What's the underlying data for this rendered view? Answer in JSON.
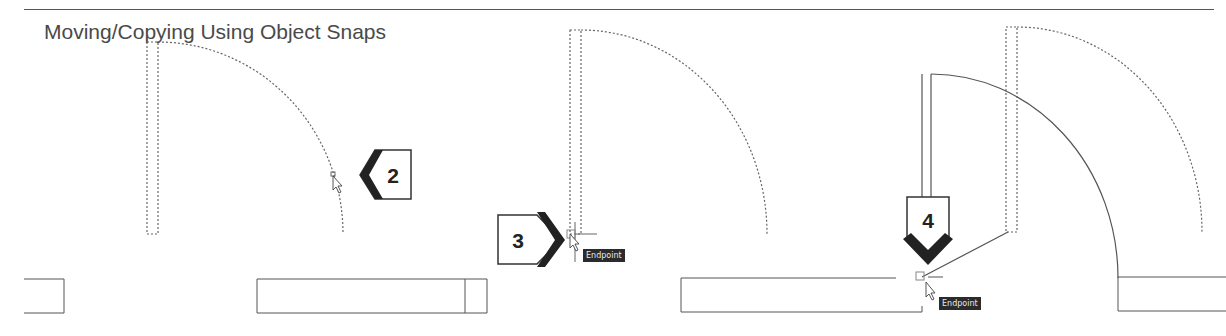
{
  "page": {
    "title": "Moving/Copying Using Object Snaps"
  },
  "callouts": [
    {
      "id": "step-2",
      "number": "2",
      "direction": "left"
    },
    {
      "id": "step-3",
      "number": "3",
      "direction": "right"
    },
    {
      "id": "step-4",
      "number": "4",
      "direction": "down"
    }
  ],
  "snap_tooltips": [
    {
      "id": "tooltip-step-3",
      "label": "Endpoint"
    },
    {
      "id": "tooltip-step-4",
      "label": "Endpoint"
    }
  ],
  "colors": {
    "line": "#555555",
    "callout_fill": "#222222",
    "tooltip_bg": "#2b2b2b"
  }
}
